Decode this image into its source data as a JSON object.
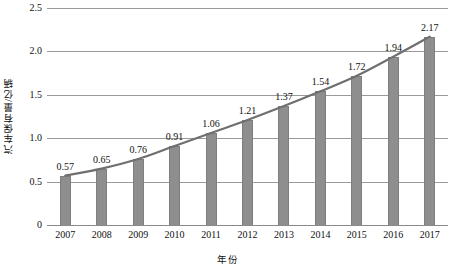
{
  "chart_data": {
    "type": "bar",
    "title": "",
    "xlabel": "年份",
    "ylabel": "汽车保有量/亿辆",
    "categories": [
      "2007",
      "2008",
      "2009",
      "2010",
      "2011",
      "2012",
      "2013",
      "2014",
      "2015",
      "2016",
      "2017"
    ],
    "values": [
      0.57,
      0.65,
      0.76,
      0.91,
      1.06,
      1.21,
      1.37,
      1.54,
      1.72,
      1.94,
      2.17
    ],
    "data_labels": [
      "0.57",
      "0.65",
      "0.76",
      "0.91",
      "1.06",
      "1.21",
      "1.37",
      "1.54",
      "1.72",
      "1.94",
      "2.17"
    ],
    "ylim": [
      0,
      2.5
    ],
    "yticks": [
      0,
      0.5,
      1,
      1.5,
      2,
      2.5
    ],
    "ytick_labels": [
      "0",
      "0.5",
      "1.0",
      "1.5",
      "2.0",
      "2.5"
    ],
    "grid": true,
    "legend": "none",
    "series": [
      {
        "name": "汽车保有量",
        "type": "bar",
        "values": [
          0.57,
          0.65,
          0.76,
          0.91,
          1.06,
          1.21,
          1.37,
          1.54,
          1.72,
          1.94,
          2.17
        ]
      },
      {
        "name": "趋势线",
        "type": "line",
        "values": [
          0.57,
          0.65,
          0.76,
          0.91,
          1.06,
          1.21,
          1.37,
          1.54,
          1.72,
          1.94,
          2.17
        ]
      }
    ],
    "colors": {
      "bar": "#8e8e8e",
      "line": "#6f6f6f",
      "grid": "#9a9a9a",
      "text": "#111111",
      "background": "#ffffff"
    }
  }
}
